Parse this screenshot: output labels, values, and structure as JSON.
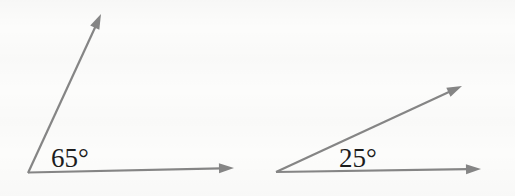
{
  "diagram": {
    "type": "geometry-angle-figures",
    "background_color": "#fcfcfb",
    "line_color": "#858585",
    "label_color": "#1c1c1c",
    "figures": [
      {
        "id": "left-angle",
        "angle_degrees": 65,
        "angle_label": "65°"
      },
      {
        "id": "right-angle",
        "angle_degrees": 25,
        "angle_label": "25°"
      }
    ]
  }
}
